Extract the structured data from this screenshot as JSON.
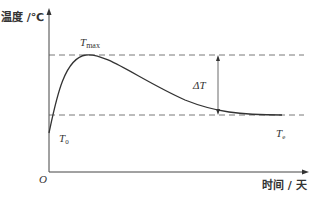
{
  "diagram": {
    "type": "temperature-time curve",
    "y_axis_label": "温度 /℃",
    "x_axis_label": "时间 / 天",
    "origin_label": "O",
    "peak_label_main": "T",
    "peak_label_sub": "max",
    "initial_label_main": "T",
    "initial_label_sub": "0",
    "final_label_main": "T",
    "final_label_sub": "e",
    "delta_label": "ΔT",
    "colors": {
      "line": "#333333",
      "dashed": "#555555",
      "background": "#ffffff"
    }
  }
}
